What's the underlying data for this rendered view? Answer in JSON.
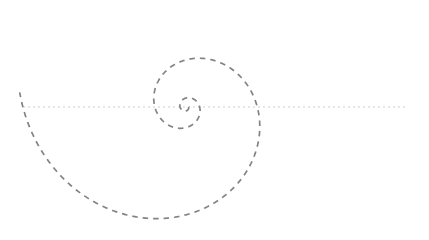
{
  "figure": {
    "title": "",
    "width": 429,
    "height": 240,
    "background_color": "#ffffff"
  },
  "axis": {
    "name": "horizontal-axis",
    "orientation": "horizontal",
    "y": 107,
    "x_start": 23,
    "x_end": 405,
    "color": "#cdcdcd",
    "stroke_width": 1,
    "dash_pattern": "2 3",
    "tick_labels": [],
    "label": ""
  },
  "chart_data": {
    "type": "line",
    "title": "",
    "subtitle": "",
    "xlabel": "",
    "ylabel": "",
    "grid": false,
    "legend": [],
    "legend_position": "none",
    "xlim": [
      -186,
      243
    ],
    "ylim": [
      -133,
      107
    ],
    "series": [
      {
        "name": "logarithmic-spiral",
        "curve_type": "logarithmic-spiral",
        "color": "#838383",
        "stroke_width": 1.7,
        "dash_pattern": "5.5 5",
        "line_cap": "butt",
        "center_x": 186,
        "center_y": 107,
        "r0": 2.6,
        "growth_b": 0.2635,
        "theta_start_deg": 0,
        "theta_end_deg": 905,
        "direction": "clockwise-outward",
        "turns": 2.51,
        "axis_crossings_right_of_center_px": [
          192,
          200,
          214,
          253,
          333
        ],
        "axis_crossings_left_of_center_px": [
          181,
          175,
          148,
          93
        ],
        "extent_top_y": 31,
        "extent_bottom_y": 224,
        "extent_left_x": 92,
        "extent_right_x": 333,
        "end_point_x": 333,
        "end_point_y": 88
      }
    ]
  }
}
